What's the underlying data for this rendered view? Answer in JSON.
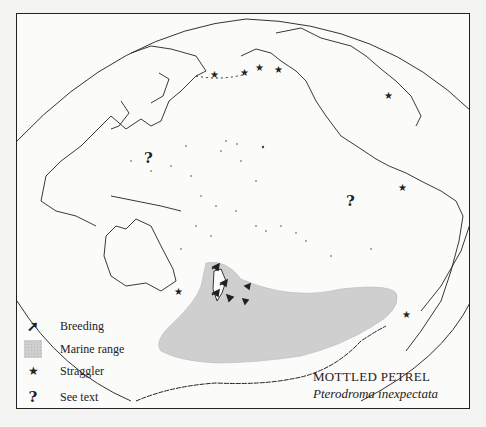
{
  "map": {
    "title": "MOTTLED PETREL",
    "scientific_name": "Pterodroma inexpectata",
    "region": "Pacific Ocean",
    "colors": {
      "frame": "#222222",
      "background": "#fbfbfa",
      "marine_range": "#cfcfcf",
      "coastline": "#222222"
    }
  },
  "legend": {
    "items": [
      {
        "icon": "breeding-arrow-icon",
        "symbol": "➚",
        "label": "Breeding"
      },
      {
        "icon": "marine-range-swatch",
        "symbol": "",
        "label": "Marine range"
      },
      {
        "icon": "star-icon",
        "symbol": "★",
        "label": "Straggler"
      },
      {
        "icon": "question-mark-icon",
        "symbol": "?",
        "label": "See text"
      }
    ]
  },
  "markers": {
    "see_text": [
      {
        "symbol": "?",
        "x": 143,
        "y": 150
      },
      {
        "symbol": "?",
        "x": 345,
        "y": 193
      }
    ],
    "stragglers": [
      {
        "symbol": "★",
        "x": 213,
        "y": 74
      },
      {
        "symbol": "★",
        "x": 243,
        "y": 72
      },
      {
        "symbol": "★",
        "x": 258,
        "y": 67
      },
      {
        "symbol": "★",
        "x": 277,
        "y": 69
      },
      {
        "symbol": "★",
        "x": 387,
        "y": 95
      },
      {
        "symbol": "★",
        "x": 401,
        "y": 187
      },
      {
        "symbol": "★",
        "x": 177,
        "y": 291
      },
      {
        "symbol": "★",
        "x": 405,
        "y": 314
      }
    ]
  }
}
